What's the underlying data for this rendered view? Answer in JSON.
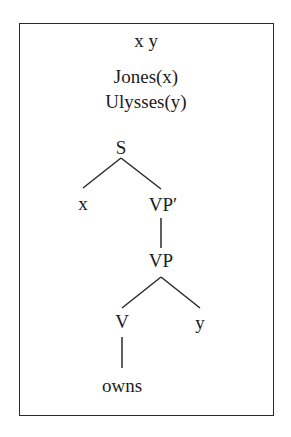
{
  "drs": {
    "universe": [
      "x",
      "y"
    ],
    "universe_label": "x  y",
    "conditions": [
      "Jones(x)",
      "Ulysses(y)"
    ]
  },
  "tree": {
    "root": "S",
    "nodes": {
      "s": "S",
      "x": "x",
      "vp_bar": "VP′",
      "vp": "VP",
      "v": "V",
      "y": "y",
      "owns": "owns"
    },
    "edges": [
      [
        "S",
        "x"
      ],
      [
        "S",
        "VP′"
      ],
      [
        "VP′",
        "VP"
      ],
      [
        "VP",
        "V"
      ],
      [
        "VP",
        "y"
      ],
      [
        "V",
        "owns"
      ]
    ]
  },
  "colors": {
    "ink": "#1c1c1c",
    "background": "#ffffff"
  }
}
